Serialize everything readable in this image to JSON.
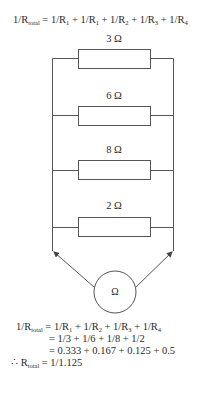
{
  "top_equation": {
    "lhs": "1/R",
    "lhs_sub": "total",
    "rhs_parts": [
      {
        "t": " = 1/R",
        "s": "1"
      },
      {
        "t": " + 1/R",
        "s": "1"
      },
      {
        "t": " + 1/R",
        "s": "2"
      },
      {
        "t": " + 1/R",
        "s": "3"
      },
      {
        "t": " + 1/R",
        "s": "4"
      }
    ]
  },
  "resistors": [
    {
      "label": "3 Ω",
      "value_ohms": 3
    },
    {
      "label": "6 Ω",
      "value_ohms": 6
    },
    {
      "label": "8 Ω",
      "value_ohms": 8
    },
    {
      "label": "2 Ω",
      "value_ohms": 2
    }
  ],
  "meter": {
    "label": "Ω",
    "type": "ohmmeter"
  },
  "calculation": {
    "line1": {
      "lhs": "1/R",
      "lhs_sub": "total",
      "rhs_parts": [
        {
          "t": " = 1/R",
          "s": "1"
        },
        {
          "t": " + 1/R",
          "s": "2"
        },
        {
          "t": " + 1/R",
          "s": "3"
        },
        {
          "t": " + 1/R",
          "s": "4"
        }
      ]
    },
    "line2": "= 1/3 + 1/6 + 1/8 + 1/2",
    "line3": "= 0.333 + 0.167 + 0.125 + 0.5",
    "line4": {
      "prefix": "∴ R",
      "sub": "total",
      "rhs": " = 1/1.125"
    }
  }
}
